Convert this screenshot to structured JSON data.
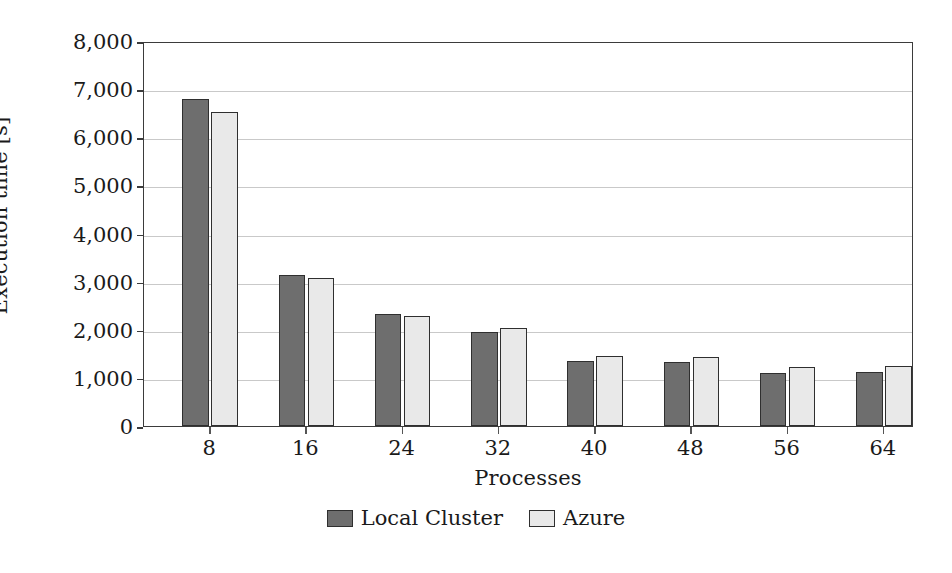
{
  "chart_data": {
    "type": "bar",
    "title": "",
    "xlabel": "Processes",
    "ylabel": "Execution time [s]",
    "categories": [
      "8",
      "16",
      "24",
      "32",
      "40",
      "48",
      "56",
      "64"
    ],
    "series": [
      {
        "name": "Local Cluster",
        "color": "#6e6e6e",
        "values": [
          6800,
          3130,
          2320,
          1950,
          1350,
          1340,
          1110,
          1120
        ]
      },
      {
        "name": "Azure",
        "color": "#e9e9e9",
        "values": [
          6530,
          3070,
          2280,
          2030,
          1450,
          1440,
          1220,
          1240
        ]
      }
    ],
    "ylim": [
      0,
      8000
    ],
    "ytick_values": [
      0,
      1000,
      2000,
      3000,
      4000,
      5000,
      6000,
      7000,
      8000
    ],
    "ytick_labels": [
      "0",
      "1,000",
      "2,000",
      "3,000",
      "4,000",
      "5,000",
      "6,000",
      "7,000",
      "8,000"
    ],
    "grid": "horizontal",
    "legend_position": "below",
    "legend_entries": [
      "Local Cluster",
      "Azure"
    ],
    "axis_frame_color": "#3b3b3b",
    "gridline_color": "#c9c9c9",
    "bar_outline_color": "#2f2f2f"
  }
}
